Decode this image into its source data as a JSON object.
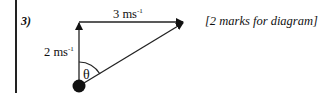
{
  "question": {
    "number": "3)",
    "marks_note": "[2 marks for diagram]"
  },
  "diagram": {
    "horizontal_vector": {
      "value": "3 ms",
      "unit_exp": "-1"
    },
    "vertical_vector": {
      "value": "2 ms",
      "unit_exp": "-1"
    },
    "angle_label": "θ",
    "colors": {
      "stroke": "#222222",
      "dot": "#111111"
    }
  }
}
